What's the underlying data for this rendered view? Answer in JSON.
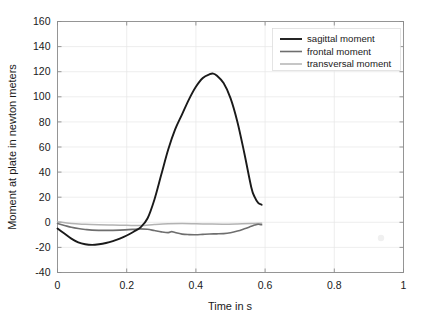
{
  "figure": {
    "background_color": "#ffffff",
    "axes_color": "#8c8c8c",
    "grid_color": "#e6e6e6",
    "text_color": "#1a1a1a"
  },
  "chart_data": {
    "type": "line",
    "title": "",
    "xlabel": "Time in s",
    "ylabel": "Moment at plate in newton meters",
    "xlim": [
      0,
      1
    ],
    "ylim": [
      -40,
      160
    ],
    "xticks": [
      0,
      0.2,
      0.4,
      0.6,
      0.8,
      1
    ],
    "xticklabels": [
      "0",
      "0.2",
      "0.4",
      "0.6",
      "0.8",
      "1"
    ],
    "yticks": [
      -40,
      -20,
      0,
      20,
      40,
      60,
      80,
      100,
      120,
      140,
      160
    ],
    "yticklabels": [
      "-40",
      "-20",
      "0",
      "20",
      "40",
      "60",
      "80",
      "100",
      "120",
      "140",
      "160"
    ],
    "grid": true,
    "legend_position": "upper right",
    "series": [
      {
        "name": "sagittal moment",
        "color": "#1a1a1a",
        "width": 1.9,
        "x": [
          0.0,
          0.02,
          0.04,
          0.06,
          0.08,
          0.1,
          0.12,
          0.14,
          0.16,
          0.18,
          0.2,
          0.22,
          0.24,
          0.26,
          0.28,
          0.3,
          0.32,
          0.34,
          0.36,
          0.38,
          0.4,
          0.42,
          0.44,
          0.45,
          0.46,
          0.48,
          0.5,
          0.52,
          0.54,
          0.56,
          0.57,
          0.58,
          0.59
        ],
        "y": [
          -5,
          -9,
          -13,
          -16,
          -17.5,
          -18,
          -17.5,
          -16.5,
          -15,
          -13,
          -10.5,
          -7.5,
          -4,
          3,
          18,
          38,
          58,
          74,
          86,
          98,
          108,
          115,
          118,
          118.5,
          117,
          111,
          99,
          80,
          55,
          28,
          20,
          15.5,
          14
        ]
      },
      {
        "name": "frontal moment",
        "color": "#6e6e6e",
        "width": 1.6,
        "x": [
          0.0,
          0.02,
          0.04,
          0.06,
          0.08,
          0.1,
          0.14,
          0.18,
          0.22,
          0.24,
          0.26,
          0.28,
          0.3,
          0.32,
          0.33,
          0.34,
          0.36,
          0.38,
          0.4,
          0.42,
          0.44,
          0.46,
          0.48,
          0.5,
          0.52,
          0.54,
          0.56,
          0.57,
          0.58,
          0.59
        ],
        "y": [
          -1,
          -2.5,
          -4,
          -5,
          -5.7,
          -6.2,
          -6.4,
          -6.2,
          -5.6,
          -5.2,
          -5.6,
          -6.6,
          -7.6,
          -8.2,
          -7.4,
          -8.2,
          -9.4,
          -9.8,
          -9.9,
          -9.6,
          -9.3,
          -9.2,
          -9.0,
          -8.3,
          -7.0,
          -5.2,
          -3.2,
          -2.2,
          -1.6,
          -2.0
        ]
      },
      {
        "name": "transversal moment",
        "color": "#b3b3b3",
        "width": 1.5,
        "x": [
          0.0,
          0.04,
          0.08,
          0.12,
          0.16,
          0.2,
          0.24,
          0.28,
          0.32,
          0.36,
          0.4,
          0.44,
          0.48,
          0.52,
          0.56,
          0.59
        ],
        "y": [
          0.5,
          -1.0,
          -1.6,
          -2.0,
          -2.2,
          -2.4,
          -2.6,
          -1.8,
          -1.2,
          -1.0,
          -1.2,
          -1.4,
          -1.5,
          -1.3,
          -1.0,
          -0.8
        ]
      }
    ]
  },
  "legend": {
    "items": [
      {
        "label": "sagittal moment"
      },
      {
        "label": "frontal moment"
      },
      {
        "label": "transversal moment"
      }
    ]
  }
}
